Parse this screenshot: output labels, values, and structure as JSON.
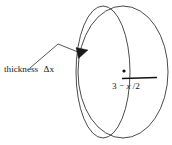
{
  "figure": {
    "background_color": "#ffffff",
    "line_color": "#2b2b2b",
    "text_color": "#1a1a1a"
  },
  "annotations": {
    "thickness_label": "thickness Δx",
    "thickness_word": "thickness",
    "thickness_symbol": "Δx",
    "radius_label": "3 − x/2",
    "radius_label_prefix": "3 − ",
    "radius_label_variable": "x",
    "radius_label_suffix": "/2"
  },
  "shapes": {
    "outer_ellipse": {
      "name": "front-face-ellipse",
      "cx": 123,
      "cy": 72,
      "rx": 45,
      "ry": 66
    },
    "inner_ellipse": {
      "name": "back-face-ellipse",
      "cx": 103,
      "cy": 72,
      "rx": 27,
      "ry": 66
    },
    "center_dot": {
      "name": "center-point",
      "cx": 124,
      "cy": 72,
      "r": 1.5
    },
    "radius_segment": {
      "name": "radius-line",
      "x1": 123,
      "y1": 78,
      "x2": 156,
      "y2": 78
    },
    "leader_line": {
      "name": "callout-leader",
      "points": "30,68 58,44 78,52"
    },
    "arrow_head": {
      "name": "leader-arrowhead",
      "points": "78,52 87,49 79,58"
    }
  }
}
